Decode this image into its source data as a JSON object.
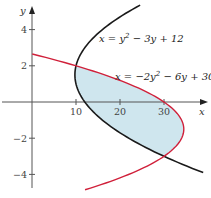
{
  "chart_data": {
    "type": "line",
    "title": "",
    "xlabel": "x",
    "ylabel": "y",
    "xlim": [
      -5,
      42
    ],
    "ylim": [
      -5.2,
      5.6
    ],
    "grid": false,
    "x_ticks": [
      10,
      20,
      30
    ],
    "y_ticks": [
      4,
      2,
      -2,
      -4
    ],
    "x_tick_labels": [
      "10",
      "20",
      "30"
    ],
    "y_tick_labels": [
      "4",
      "2",
      "−2",
      "−4"
    ],
    "series": [
      {
        "name": "x = y² − 3y + 12",
        "color": "#1a1a1a",
        "coeffs": {
          "a": 1,
          "b": -3,
          "c": 12
        },
        "y_range": [
          -3.9,
          5.35
        ]
      },
      {
        "name": "x = −2y² − 6y + 30",
        "color": "#d0203a",
        "coeffs": {
          "a": -2,
          "b": -6,
          "c": 30
        },
        "y_range": [
          -4.85,
          2.65
        ]
      }
    ],
    "shaded_region": {
      "between": [
        "x = y² − 3y + 12",
        "x = −2y² − 6y + 30"
      ],
      "y_range": [
        -3,
        2
      ],
      "color": "#cfe6ee"
    },
    "intersections": [
      [
        10,
        2
      ],
      [
        30,
        -3
      ]
    ],
    "annotations": [
      {
        "text": "x = y² − 3y + 12",
        "at": [
          23,
          3.5
        ]
      },
      {
        "text": "x = −2y² − 6y + 30",
        "at": [
          23,
          1.7
        ]
      }
    ]
  },
  "labels": {
    "x_axis": "x",
    "y_axis": "y",
    "eq1_prefix": "x = y",
    "eq1_sup": "2",
    "eq1_suffix": " − 3y + 12",
    "eq2_prefix": "x = −2y",
    "eq2_sup": "2",
    "eq2_suffix": " − 6y + 30"
  }
}
